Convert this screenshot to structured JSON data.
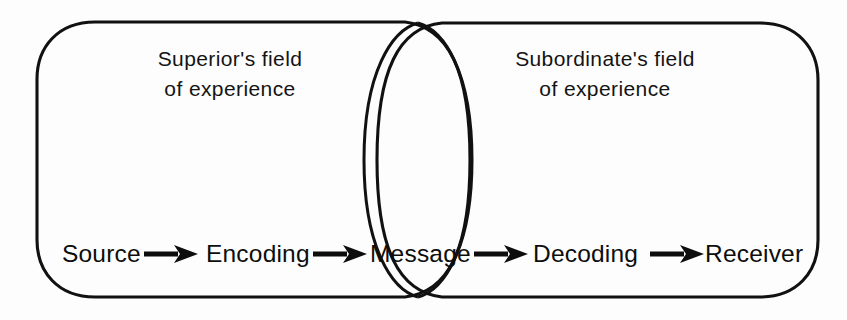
{
  "diagram": {
    "background_color": "#fdfdfd",
    "line_color": "#111111",
    "text_color": "#0d0d0d",
    "fields": [
      {
        "id": "superior",
        "label_line1": "Superior's field",
        "label_line2": "of experience",
        "label_center_x": 230,
        "label_line1_y": 66,
        "label_line2_y": 96
      },
      {
        "id": "subordinate",
        "label_line1": "Subordinate's field",
        "label_line2": "of experience",
        "label_center_x": 605,
        "label_line1_y": 66,
        "label_line2_y": 96
      }
    ],
    "overlap": {
      "id": "message-overlap",
      "shape": "lens",
      "center_x": 418,
      "top_y": 23,
      "bottom_y": 297,
      "half_width": 54
    },
    "flow": {
      "baseline_y": 262,
      "stages": [
        {
          "id": "source",
          "label": "Source",
          "x": 62
        },
        {
          "id": "encoding",
          "label": "Encoding",
          "x": 206
        },
        {
          "id": "message",
          "label": "Message",
          "x": 370
        },
        {
          "id": "decoding",
          "label": "Decoding",
          "x": 533
        },
        {
          "id": "receiver",
          "label": "Receiver",
          "x": 705
        }
      ],
      "arrows": [
        {
          "id": "arrow-source-encoding",
          "from": "source",
          "to": "encoding",
          "x1": 144,
          "x2": 196,
          "y": 254
        },
        {
          "id": "arrow-encoding-message",
          "from": "encoding",
          "to": "message",
          "x1": 313,
          "x2": 365,
          "y": 254
        },
        {
          "id": "arrow-message-decoding",
          "from": "message",
          "to": "decoding",
          "x1": 474,
          "x2": 526,
          "y": 254
        },
        {
          "id": "arrow-decoding-receiver",
          "from": "decoding",
          "to": "receiver",
          "x1": 650,
          "x2": 702,
          "y": 254
        }
      ]
    }
  }
}
